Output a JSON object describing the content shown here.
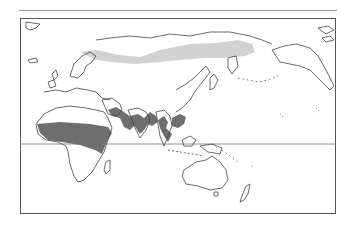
{
  "map": {
    "type": "world-distribution-map",
    "projection": "pacific-centered",
    "has_equator_line": true,
    "colors": {
      "coastline": "#444444",
      "range_dark": "#6e6e6e",
      "range_light": "#d2d2d2",
      "frame": "#555555",
      "equator": "#777777"
    },
    "regions": [
      {
        "name": "sahel-africa-arabia",
        "shade": "dark"
      },
      {
        "name": "south-asia-indochina",
        "shade": "dark"
      },
      {
        "name": "siberia-taiga",
        "shade": "light"
      }
    ]
  }
}
